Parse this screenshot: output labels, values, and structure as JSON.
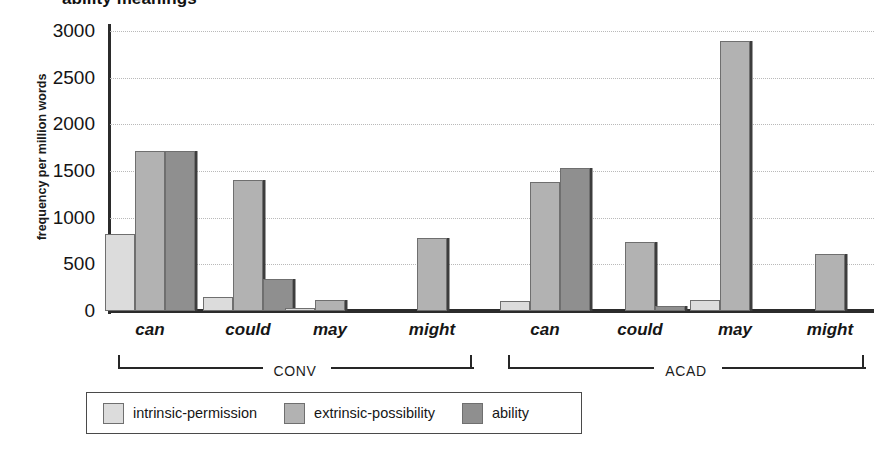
{
  "chart_data": {
    "type": "bar",
    "title": "ability meanings",
    "xlabel": "",
    "ylabel": "frequency per million words",
    "ylim": [
      0,
      3000
    ],
    "yticks": [
      0,
      500,
      1000,
      1500,
      2000,
      2500,
      3000
    ],
    "grid": true,
    "legend_position": "bottom",
    "categories": [
      "can",
      "could",
      "may",
      "might",
      "can",
      "could",
      "may",
      "might"
    ],
    "groups": [
      {
        "name": "CONV",
        "categories": [
          "can",
          "could",
          "may",
          "might"
        ]
      },
      {
        "name": "ACAD",
        "categories": [
          "can",
          "could",
          "may",
          "might"
        ]
      }
    ],
    "series": [
      {
        "name": "intrinsic-permission",
        "color": "#dcdcdc",
        "values": [
          830,
          150,
          35,
          0,
          110,
          0,
          120,
          0
        ]
      },
      {
        "name": "extrinsic-possibility",
        "color": "#b2b2b2",
        "values": [
          1710,
          1400,
          120,
          780,
          1380,
          740,
          2890,
          610
        ]
      },
      {
        "name": "ability",
        "color": "#8f8f8f",
        "values": [
          1710,
          340,
          0,
          0,
          1530,
          50,
          0,
          0
        ]
      }
    ]
  },
  "legend": {
    "items": [
      {
        "label": "intrinsic-permission",
        "swatch": "legend-swatch-intrinsic-permission"
      },
      {
        "label": "extrinsic-possibility",
        "swatch": "legend-swatch-extrinsic-possibility"
      },
      {
        "label": "ability",
        "swatch": "legend-swatch-ability"
      }
    ]
  }
}
